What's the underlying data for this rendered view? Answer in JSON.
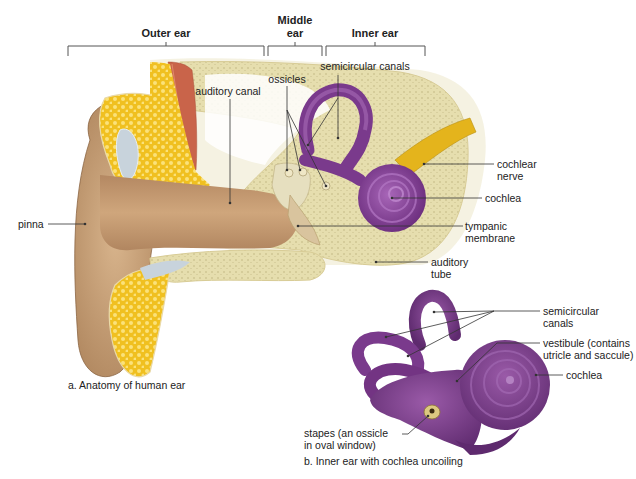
{
  "brackets": {
    "outer": "Outer ear",
    "middle_1": "Middle",
    "middle_2": "ear",
    "inner": "Inner ear"
  },
  "labels_a": {
    "auditory_canal": "auditory canal",
    "ossicles": "ossicles",
    "semicircular_canals": "semicircular canals",
    "pinna": "pinna",
    "cochlear_nerve_1": "cochlear",
    "cochlear_nerve_2": "nerve",
    "cochlea": "cochlea",
    "tympanic_1": "tympanic",
    "tympanic_2": "membrane",
    "auditory_tube_1": "auditory",
    "auditory_tube_2": "tube"
  },
  "labels_b": {
    "semicircular_1": "semicircular",
    "semicircular_2": "canals",
    "vestibule_1": "vestibule (contains",
    "vestibule_2": "utricle and saccule)",
    "cochlea": "cochlea",
    "stapes_1": "stapes (an ossicle",
    "stapes_2": "in oval window)"
  },
  "captions": {
    "a": "a. Anatomy of human ear",
    "b": "b. Inner ear with cochlea uncoiling"
  },
  "colors": {
    "skin": "#c9a27a",
    "skin_dark": "#9c7450",
    "bone": "#e8dfae",
    "fat": "#f3c51f",
    "cartilage": "#c8d3dc",
    "muscle": "#c9644a",
    "inner_ear": "#7a3a8c",
    "inner_ear_light": "#9a5aad",
    "nerve": "#e4b41c"
  }
}
